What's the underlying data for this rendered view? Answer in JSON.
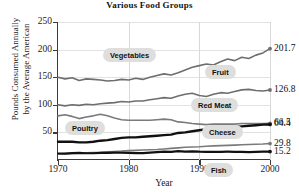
{
  "chart_data": {
    "type": "line",
    "title": "Various Food Groups",
    "xlabel": "Year",
    "ylabel_line1": "Pounds Consumed Annually",
    "ylabel_line2": "by the Average American",
    "xlim": [
      1970,
      2000
    ],
    "ylim": [
      0,
      250
    ],
    "yticks": [
      250,
      200,
      150,
      100,
      50
    ],
    "xticks": [
      1970,
      1980,
      1990,
      2000
    ],
    "grid": true,
    "legend_position": "inline-callouts",
    "x": [
      1970,
      1971,
      1972,
      1973,
      1974,
      1975,
      1976,
      1977,
      1978,
      1979,
      1980,
      1981,
      1982,
      1983,
      1984,
      1985,
      1986,
      1987,
      1988,
      1989,
      1990,
      1991,
      1992,
      1993,
      1994,
      1995,
      1996,
      1997,
      1998,
      1999,
      2000
    ],
    "series": [
      {
        "name": "Vegetables",
        "end_value": "201.7",
        "end_value_num": 201.7,
        "color": "#6e6e6e",
        "width": 1.6,
        "values": [
          150,
          147,
          149,
          144,
          147,
          146,
          145,
          143,
          144,
          146,
          145,
          148,
          146,
          150,
          153,
          156,
          154,
          158,
          163,
          168,
          171,
          174,
          172,
          178,
          183,
          180,
          186,
          184,
          190,
          194,
          201.7
        ]
      },
      {
        "name": "Fruit",
        "end_value": "126.8",
        "end_value_num": 126.8,
        "color": "#6e6e6e",
        "width": 1.6,
        "values": [
          100,
          98,
          100,
          99,
          101,
          100,
          102,
          103,
          104,
          106,
          105,
          107,
          107,
          109,
          111,
          113,
          112,
          116,
          119,
          121,
          117,
          115,
          119,
          122,
          121,
          124,
          127,
          128,
          126,
          125,
          126.8
        ]
      },
      {
        "name": "Red Meat",
        "end_value": "66.5",
        "end_value_num": 66.5,
        "color": "#7a7a7a",
        "width": 1.6,
        "values": [
          80,
          82,
          79,
          75,
          78,
          80,
          83,
          80,
          76,
          73,
          72,
          72,
          72,
          72,
          73,
          74,
          73,
          69,
          68,
          66,
          65,
          64,
          65,
          65,
          65,
          65,
          66,
          66,
          66,
          66,
          66.5
        ]
      },
      {
        "name": "Poultry",
        "end_value": "64.4",
        "end_value_num": 64.4,
        "color": "#111111",
        "width": 2.4,
        "values": [
          33,
          33,
          33,
          32,
          32,
          33,
          35,
          36,
          38,
          40,
          41,
          41,
          42,
          43,
          44,
          45,
          46,
          49,
          50,
          52,
          54,
          56,
          58,
          59,
          60,
          60,
          61,
          62,
          63,
          64,
          64.4
        ]
      },
      {
        "name": "Cheese",
        "end_value": "29.8",
        "end_value_num": 29.8,
        "color": "#7a7a7a",
        "width": 1.6,
        "values": [
          11,
          11.5,
          12,
          12.5,
          13,
          13.5,
          14,
          15,
          15.5,
          16,
          17,
          17.5,
          18,
          18.5,
          19,
          20,
          21,
          22,
          23,
          23.5,
          24,
          25,
          25.5,
          26,
          26.5,
          27,
          27.5,
          28,
          28.5,
          29,
          29.8
        ]
      },
      {
        "name": "Fish",
        "end_value": "15.2",
        "end_value_num": 15.2,
        "color": "#111111",
        "width": 2.2,
        "values": [
          11.8,
          11.5,
          12.5,
          12.8,
          12.2,
          12.2,
          13,
          12.8,
          13.4,
          13.1,
          12.8,
          12.6,
          12.4,
          13.3,
          14.1,
          15,
          14.7,
          16.2,
          15.1,
          15.6,
          15,
          14.8,
          14.7,
          14.9,
          15,
          14.9,
          14.7,
          14.3,
          14.8,
          15.2,
          15.2
        ]
      }
    ],
    "callouts": [
      {
        "label": "Vegetables",
        "left": 104,
        "top": 49
      },
      {
        "label": "Fruit",
        "left": 206,
        "top": 66
      },
      {
        "label": "Red Meat",
        "left": 192,
        "top": 99
      },
      {
        "label": "Poultry",
        "left": 66,
        "top": 122
      },
      {
        "label": "Cheese",
        "left": 203,
        "top": 126
      },
      {
        "label": "Fish",
        "left": 205,
        "top": 164
      }
    ]
  }
}
